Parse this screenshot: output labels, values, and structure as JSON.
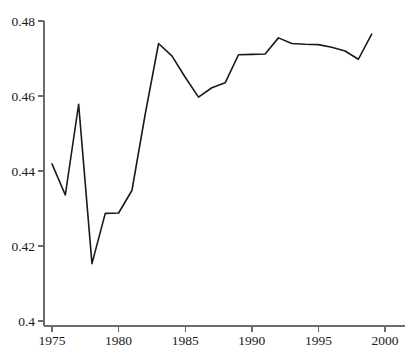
{
  "chart_data": {
    "type": "line",
    "title": "",
    "subtitle": "",
    "xlabel": "",
    "ylabel": "",
    "xlim": [
      1974.0,
      2000.5
    ],
    "ylim": [
      0.4,
      0.48
    ],
    "grid": false,
    "legend": null,
    "x_ticks": [
      1975,
      1980,
      1985,
      1990,
      1995,
      2000
    ],
    "x_tick_labels": [
      "1975",
      "1980",
      "1985",
      "1990",
      "1995",
      "2000"
    ],
    "y_ticks": [
      0.4,
      0.42,
      0.44,
      0.46,
      0.48
    ],
    "y_tick_labels": [
      "0.4",
      "0.42",
      "0.44",
      "0.46",
      "0.48"
    ],
    "series": [
      {
        "name": "series-1",
        "color": "#1a1a1a",
        "line_width": 1.6,
        "x": [
          1975,
          1976,
          1977,
          1978,
          1979,
          1980,
          1981,
          1982,
          1983,
          1984,
          1985,
          1986,
          1987,
          1988,
          1989,
          1990,
          1991,
          1992,
          1993,
          1994,
          1995,
          1996,
          1997,
          1998,
          1999
        ],
        "values": [
          0.4419,
          0.4336,
          0.4578,
          0.4153,
          0.4287,
          0.4288,
          0.4348,
          0.4552,
          0.474,
          0.4707,
          0.465,
          0.4597,
          0.4622,
          0.4635,
          0.471,
          0.4711,
          0.4712,
          0.4755,
          0.474,
          0.4738,
          0.4737,
          0.473,
          0.472,
          0.4698,
          0.4765
        ]
      }
    ],
    "axis_color": "#6b6b6b",
    "background": "#ffffff"
  },
  "geometry": {
    "plot_left": 52,
    "plot_right": 385,
    "plot_top": 21,
    "plot_bottom": 321,
    "axis_x": 44,
    "axis_y": 326
  }
}
